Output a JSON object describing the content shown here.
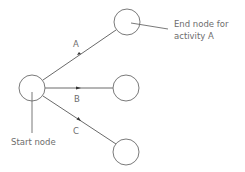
{
  "diagram": {
    "type": "activity-on-arrow network fragment",
    "nodes": [
      {
        "id": "start",
        "cx": 32,
        "cy": 88,
        "r": 13
      },
      {
        "id": "end-a",
        "cx": 127,
        "cy": 22,
        "r": 13
      },
      {
        "id": "end-b",
        "cx": 126,
        "cy": 88,
        "r": 13
      },
      {
        "id": "end-c",
        "cx": 126,
        "cy": 152,
        "r": 13
      }
    ],
    "edges": [
      {
        "id": "A",
        "label": "A",
        "from": "start",
        "to": "end-a"
      },
      {
        "id": "B",
        "label": "B",
        "from": "start",
        "to": "end-b"
      },
      {
        "id": "C",
        "label": "C",
        "from": "start",
        "to": "end-c"
      }
    ],
    "annotations": {
      "end_node_line1": "End node for",
      "end_node_line2": "activity A",
      "start_node": "Start node"
    },
    "colors": {
      "stroke": "#7a7a7a",
      "text": "#6d6d6d",
      "arrowhead": "#333333"
    }
  }
}
